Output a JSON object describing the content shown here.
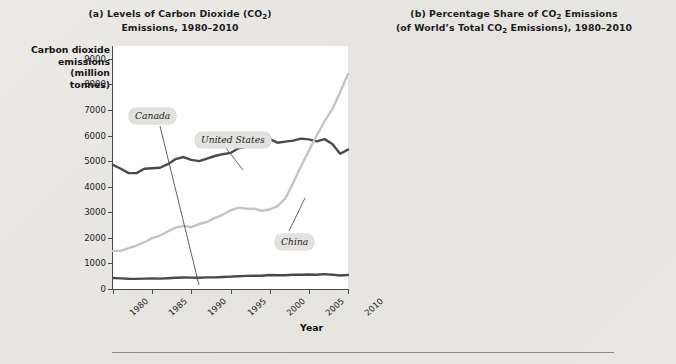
{
  "figure": {
    "x_axis_name": "Year",
    "hr_divider": true
  },
  "panel_a": {
    "title_line1": "(a) Levels of Carbon Dioxide (CO",
    "title_sub": "2",
    "title_line1_end": ")",
    "title_line2": "Emissions, 1980–2010",
    "ylabel": "Carbon dioxide\nemissions\n(million\ntonnes)",
    "ylabel_lines": [
      "Carbon dioxide",
      "emissions",
      "(million",
      "tonnes)"
    ],
    "yticks": [
      "0",
      "1000",
      "2000",
      "3000",
      "4000",
      "5000",
      "6000",
      "7000",
      "8000",
      "9000"
    ],
    "xticks": [
      "1980",
      "1985",
      "1990",
      "1995",
      "2000",
      "2005",
      "2010"
    ],
    "tags": [
      {
        "name": "Canada",
        "x": 16,
        "y": 62
      },
      {
        "name": "United States",
        "x": 82,
        "y": 86
      },
      {
        "name": "China",
        "x": 162,
        "y": 188
      }
    ]
  },
  "panel_b": {
    "title_line1": "(b) Percentage Share of CO",
    "title_sub": "2",
    "title_line1_end": " Emissions",
    "title_line2_a": "(of World’s Total CO",
    "title_line2_sub": "2",
    "title_line2_b": " Emissions), 1980–2010",
    "ylabel": "Percentage",
    "yticks": [
      "0",
      "5",
      "10",
      "15",
      "20",
      "25",
      "30%"
    ],
    "xticks": [
      "1980",
      "1985",
      "1990",
      "1995",
      "2000",
      "2005",
      "2010"
    ],
    "tags": [
      {
        "name": "Canada",
        "x": 14,
        "y": 20
      },
      {
        "name": "United States",
        "x": 110,
        "y": 47
      },
      {
        "name": "China",
        "x": 88,
        "y": 125
      }
    ]
  },
  "colors": {
    "united_states": "#4a4a4a",
    "china": "#c4c4c4",
    "canada": "#4a4a4a",
    "plot_background": "#ffffff",
    "page_background": "#e8e7e3",
    "axis": "#4a4a4a",
    "tag_background": "#e3e2df"
  },
  "chart_data": [
    {
      "type": "line",
      "id": "panel_a",
      "title": "(a) Levels of Carbon Dioxide (CO2) Emissions, 1980–2010",
      "xlabel": "Year",
      "ylabel": "Carbon dioxide emissions (million tonnes)",
      "xlim": [
        1980,
        2010
      ],
      "ylim": [
        0,
        9500
      ],
      "yticks": [
        0,
        1000,
        2000,
        3000,
        4000,
        5000,
        6000,
        7000,
        8000,
        9000
      ],
      "xticks": [
        1980,
        1985,
        1990,
        1995,
        2000,
        2005,
        2010
      ],
      "grid": false,
      "legend": "inline-labels",
      "x": [
        1980,
        1981,
        1982,
        1983,
        1984,
        1985,
        1986,
        1987,
        1988,
        1989,
        1990,
        1991,
        1992,
        1993,
        1994,
        1995,
        1996,
        1997,
        1998,
        1999,
        2000,
        2001,
        2002,
        2003,
        2004,
        2005,
        2006,
        2007,
        2008,
        2009,
        2010
      ],
      "series": [
        {
          "name": "United States",
          "color": "#4a4a4a",
          "values": [
            4850,
            4700,
            4530,
            4530,
            4700,
            4720,
            4740,
            4880,
            5080,
            5160,
            5050,
            5000,
            5100,
            5200,
            5270,
            5320,
            5500,
            5570,
            5580,
            5670,
            5860,
            5720,
            5760,
            5800,
            5880,
            5850,
            5770,
            5860,
            5670,
            5290,
            5450
          ]
        },
        {
          "name": "China",
          "color": "#c4c4c4",
          "values": [
            1490,
            1490,
            1600,
            1700,
            1830,
            1990,
            2090,
            2250,
            2400,
            2470,
            2420,
            2540,
            2620,
            2780,
            2900,
            3070,
            3180,
            3140,
            3140,
            3060,
            3110,
            3240,
            3540,
            4150,
            4800,
            5400,
            6000,
            6550,
            7030,
            7700,
            8400
          ]
        },
        {
          "name": "Canada",
          "color": "#4a4a4a",
          "values": [
            430,
            415,
            400,
            395,
            405,
            410,
            405,
            420,
            440,
            450,
            445,
            440,
            455,
            455,
            470,
            485,
            500,
            515,
            520,
            520,
            545,
            535,
            540,
            555,
            560,
            565,
            560,
            580,
            560,
            530,
            550
          ]
        }
      ]
    },
    {
      "type": "line",
      "id": "panel_b",
      "title": "(b) Percentage Share of CO2 Emissions (of World’s Total CO2 Emissions), 1980–2010",
      "xlabel": "Year",
      "ylabel": "Percentage",
      "xlim": [
        1980,
        2010
      ],
      "ylim": [
        0,
        31
      ],
      "yticks": [
        0,
        5,
        10,
        15,
        20,
        25,
        30
      ],
      "ytick_labels": [
        "0",
        "5",
        "10",
        "15",
        "20",
        "25",
        "30%"
      ],
      "xticks": [
        1980,
        1985,
        1990,
        1995,
        2000,
        2005,
        2010
      ],
      "grid": false,
      "legend": "inline-labels",
      "x": [
        1980,
        1981,
        1982,
        1983,
        1984,
        1985,
        1986,
        1987,
        1988,
        1989,
        1990,
        1991,
        1992,
        1993,
        1994,
        1995,
        1996,
        1997,
        1998,
        1999,
        2000,
        2001,
        2002,
        2003,
        2004,
        2005,
        2006,
        2007,
        2008,
        2009,
        2010
      ],
      "series": [
        {
          "name": "United States",
          "color": "#4a4a4a",
          "values": [
            25.8,
            25.4,
            24.6,
            24.4,
            24.3,
            24.0,
            23.8,
            23.6,
            23.4,
            23.3,
            23.1,
            23.4,
            23.5,
            23.2,
            23.5,
            23.3,
            23.6,
            23.5,
            23.7,
            23.9,
            24.3,
            23.6,
            23.2,
            22.5,
            21.8,
            21.1,
            20.2,
            20.1,
            19.3,
            18.2,
            17.5
          ]
        },
        {
          "name": "China",
          "color": "#c4c4c4",
          "values": [
            8.0,
            8.2,
            8.6,
            9.0,
            9.4,
            9.9,
            10.2,
            10.7,
            11.0,
            11.1,
            11.2,
            11.6,
            11.9,
            12.4,
            12.8,
            13.3,
            13.2,
            12.9,
            12.8,
            12.5,
            12.3,
            12.8,
            13.8,
            15.7,
            17.4,
            19.0,
            20.5,
            21.6,
            22.7,
            24.5,
            26.0
          ]
        },
        {
          "name": "Canada",
          "color": "#4a4a4a",
          "values": [
            2.3,
            2.2,
            2.2,
            2.1,
            2.1,
            2.1,
            2.0,
            2.0,
            2.0,
            2.0,
            2.0,
            2.0,
            2.1,
            2.0,
            2.1,
            2.1,
            2.1,
            2.1,
            2.1,
            2.1,
            2.2,
            2.2,
            2.2,
            2.2,
            2.1,
            2.0,
            1.9,
            2.0,
            1.9,
            1.8,
            1.8
          ]
        }
      ]
    }
  ]
}
